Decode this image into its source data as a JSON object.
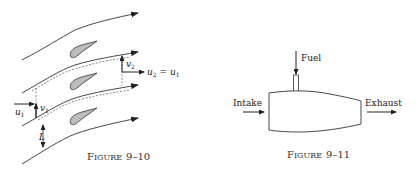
{
  "figure_10": {
    "caption": "Figure 9–10",
    "caption_big": "F",
    "caption_small": "IGURE",
    "caption_num": "9–10",
    "labels": {
      "u1": "u",
      "u1_sub": "1",
      "v1": "v",
      "v1_sub": "1",
      "v2": "v",
      "v2_sub": "2",
      "u2": "u",
      "u2_sub": "2",
      "eq": " = ",
      "u2_rhs": "u",
      "u2_rhs_sub": "1",
      "L": "L"
    }
  },
  "figure_11": {
    "caption": "Figure 9–11",
    "caption_big": "F",
    "caption_small": "IGURE",
    "caption_num": "9–11",
    "labels": {
      "fuel": "Fuel",
      "intake": "Intake",
      "exhaust": "Exhaust"
    }
  },
  "colors": {
    "line": "#333333",
    "airfoil_fill": "#bdbdbd"
  }
}
